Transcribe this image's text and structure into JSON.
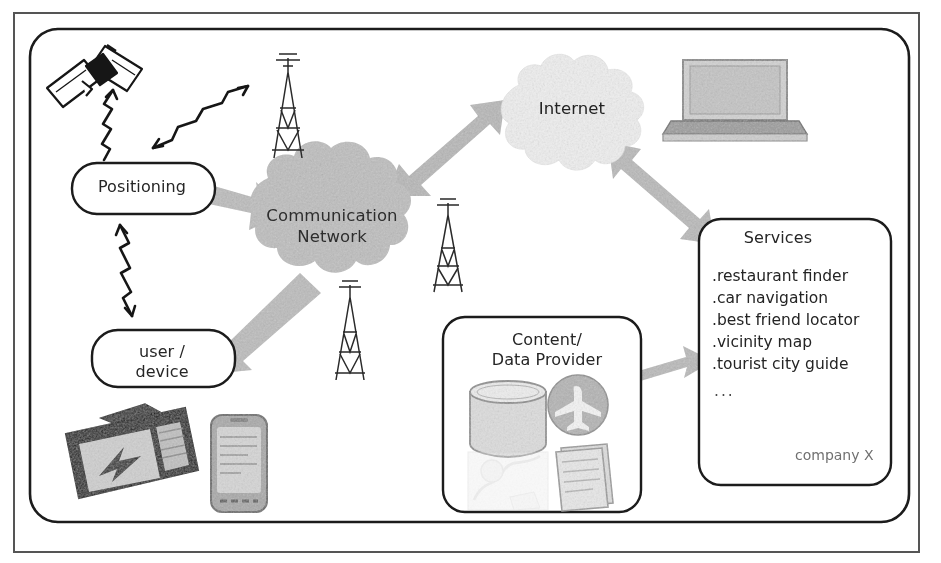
{
  "diagram": {
    "nodes": {
      "positioning": {
        "label": "Positioning",
        "shape": "rounded-box"
      },
      "user_device": {
        "label": "user /\ndevice",
        "shape": "rounded-box"
      },
      "communication_network": {
        "label": "Communication\nNetwork",
        "shape": "cloud"
      },
      "internet": {
        "label": "Internet",
        "shape": "cloud"
      },
      "content_provider": {
        "label": "Content/\nData Provider",
        "shape": "rounded-box"
      },
      "services": {
        "label": "Services",
        "shape": "rounded-box"
      }
    },
    "services": {
      "title": "Services",
      "items": [
        ".restaurant finder",
        ".car navigation",
        ".best friend locator",
        ".vicinity map",
        ".tourist city guide"
      ],
      "ellipsis": "...",
      "owner": "company X"
    },
    "icons": [
      {
        "name": "satellite-icon",
        "label": "satellite"
      },
      {
        "name": "cell-tower-icon-top",
        "label": "cell tower"
      },
      {
        "name": "cell-tower-icon-right",
        "label": "cell tower"
      },
      {
        "name": "cell-tower-icon-bottom",
        "label": "cell tower"
      },
      {
        "name": "laptop-icon",
        "label": "laptop computer"
      },
      {
        "name": "navigation-device-icon",
        "label": "portable navigation device"
      },
      {
        "name": "smartphone-icon",
        "label": "smartphone"
      },
      {
        "name": "database-icon",
        "label": "database cylinder"
      },
      {
        "name": "airplane-badge-icon",
        "label": "airplane circle"
      },
      {
        "name": "map-photo-icon",
        "label": "faded map photo"
      },
      {
        "name": "documents-stack-icon",
        "label": "stack of documents"
      }
    ],
    "connectors": [
      {
        "name": "satellite-to-positioning-link",
        "style": "lightning-arrow",
        "direction": "down"
      },
      {
        "name": "positioning-to-tower-link",
        "style": "lightning-arrow",
        "direction": "both"
      },
      {
        "name": "positioning-to-user-link",
        "style": "lightning-arrow",
        "direction": "both"
      },
      {
        "name": "positioning-to-network-arrow",
        "style": "block-arrow",
        "direction": "right"
      },
      {
        "name": "network-to-user-arrow",
        "style": "block-arrow",
        "direction": "down-left"
      },
      {
        "name": "network-to-internet-arrow",
        "style": "block-arrow",
        "direction": "both"
      },
      {
        "name": "internet-to-services-arrow",
        "style": "block-arrow",
        "direction": "both"
      },
      {
        "name": "provider-to-services-arrow",
        "style": "block-arrow",
        "direction": "both"
      }
    ],
    "colors": {
      "arrow_fill": "#b9b9b9",
      "cloud_network_fill": "#bdbdbd",
      "cloud_internet_fill": "#ededed",
      "stroke": "#1e1e1e",
      "text": "#262626",
      "muted_text": "#707070"
    }
  }
}
